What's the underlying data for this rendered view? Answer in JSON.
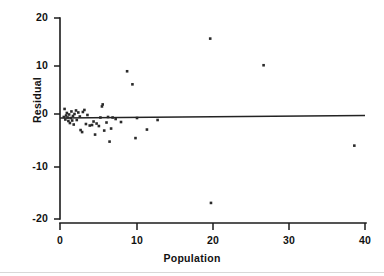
{
  "chart_data": {
    "type": "scatter",
    "title": "",
    "xlabel": "Population",
    "ylabel": "Residual",
    "xlim": [
      0,
      40
    ],
    "ylim": [
      -20,
      20
    ],
    "xticks": [
      0,
      10,
      20,
      30,
      40
    ],
    "yticks": [
      20,
      10,
      0,
      -10,
      -20
    ],
    "xtick_labels": [
      "0",
      "10",
      "20",
      "30",
      "40"
    ],
    "ytick_labels": [
      "20",
      "10",
      "0",
      "-10",
      "-20"
    ],
    "grid": false,
    "legend": null,
    "legend_position": "none",
    "marker": "square",
    "marker_color": "#2a2a2a",
    "reference_line": {
      "name": "zero-residual-fit-line",
      "type": "line",
      "x": [
        0,
        40
      ],
      "y": [
        0.1,
        0.6
      ],
      "color": "#232323"
    },
    "series": [
      {
        "name": "Residuals vs Population",
        "color": "#2a2a2a",
        "points": [
          [
            0.5,
            0.3
          ],
          [
            0.6,
            1.9
          ],
          [
            0.7,
            -0.2
          ],
          [
            0.8,
            0.6
          ],
          [
            0.9,
            1.1
          ],
          [
            1.0,
            0.2
          ],
          [
            1.1,
            -0.5
          ],
          [
            1.2,
            0.8
          ],
          [
            1.3,
            -0.9
          ],
          [
            1.4,
            0.1
          ],
          [
            1.5,
            1.4
          ],
          [
            1.6,
            -0.4
          ],
          [
            1.7,
            0.5
          ],
          [
            1.8,
            -1.2
          ],
          [
            1.9,
            0.9
          ],
          [
            2.1,
            1.6
          ],
          [
            2.2,
            -0.3
          ],
          [
            2.4,
            1.2
          ],
          [
            2.6,
            0.4
          ],
          [
            2.7,
            -2.3
          ],
          [
            2.9,
            -2.7
          ],
          [
            3.0,
            1.3
          ],
          [
            3.2,
            1.7
          ],
          [
            3.4,
            -1.1
          ],
          [
            3.6,
            0.7
          ],
          [
            3.9,
            -1.4
          ],
          [
            4.2,
            -1.3
          ],
          [
            4.4,
            -0.6
          ],
          [
            4.6,
            -3.2
          ],
          [
            4.8,
            -1.0
          ],
          [
            5.1,
            -1.5
          ],
          [
            5.3,
            0.2
          ],
          [
            5.5,
            2.4
          ],
          [
            5.6,
            2.8
          ],
          [
            5.8,
            -2.4
          ],
          [
            6.1,
            -0.8
          ],
          [
            6.3,
            0.3
          ],
          [
            6.5,
            -4.6
          ],
          [
            6.7,
            -2.0
          ],
          [
            6.9,
            0.2
          ],
          [
            7.3,
            -0.1
          ],
          [
            8.0,
            -0.7
          ],
          [
            8.8,
            9.4
          ],
          [
            9.5,
            6.8
          ],
          [
            9.9,
            -3.9
          ],
          [
            10.1,
            0.1
          ],
          [
            11.4,
            -2.2
          ],
          [
            12.8,
            -0.3
          ],
          [
            19.7,
            15.9
          ],
          [
            19.8,
            -16.8
          ],
          [
            26.7,
            10.6
          ],
          [
            38.6,
            -5.4
          ]
        ]
      }
    ]
  },
  "axes": {
    "ylabel_text": "Residual",
    "xlabel_text": "Population"
  }
}
